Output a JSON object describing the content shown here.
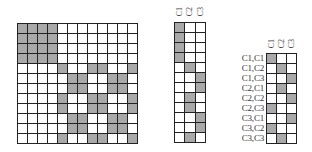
{
  "colors": {
    "filled": "#a9a9a9",
    "empty": "#ffffff",
    "line": "#222222"
  },
  "big_matrix": {
    "rows": 12,
    "cols": 12,
    "cells": [
      [
        1,
        1,
        1,
        1,
        0,
        0,
        0,
        0,
        0,
        0,
        0,
        0
      ],
      [
        1,
        1,
        1,
        1,
        0,
        0,
        0,
        0,
        0,
        0,
        0,
        0
      ],
      [
        1,
        1,
        1,
        1,
        0,
        0,
        0,
        0,
        0,
        0,
        0,
        0
      ],
      [
        1,
        1,
        1,
        1,
        0,
        0,
        0,
        0,
        0,
        0,
        0,
        0
      ],
      [
        0,
        0,
        0,
        0,
        1,
        0,
        0,
        1,
        1,
        0,
        0,
        1
      ],
      [
        0,
        0,
        0,
        0,
        0,
        1,
        1,
        0,
        0,
        1,
        1,
        0
      ],
      [
        0,
        0,
        0,
        0,
        0,
        1,
        1,
        0,
        0,
        1,
        1,
        0
      ],
      [
        0,
        0,
        0,
        0,
        1,
        0,
        0,
        1,
        1,
        0,
        0,
        1
      ],
      [
        0,
        0,
        0,
        0,
        1,
        0,
        0,
        1,
        1,
        0,
        0,
        1
      ],
      [
        0,
        0,
        0,
        0,
        0,
        1,
        1,
        0,
        0,
        1,
        1,
        0
      ],
      [
        0,
        0,
        0,
        0,
        0,
        1,
        1,
        0,
        0,
        1,
        1,
        0
      ],
      [
        0,
        0,
        0,
        0,
        1,
        0,
        0,
        1,
        1,
        0,
        0,
        1
      ]
    ]
  },
  "middle_matrix": {
    "col_headers": [
      "C1",
      "C2",
      "C3"
    ],
    "rows": 12,
    "cols": 3,
    "cells": [
      [
        1,
        0,
        0
      ],
      [
        1,
        0,
        0
      ],
      [
        1,
        0,
        0
      ],
      [
        1,
        0,
        0
      ],
      [
        0,
        1,
        0
      ],
      [
        0,
        0,
        1
      ],
      [
        0,
        0,
        1
      ],
      [
        0,
        1,
        0
      ],
      [
        0,
        1,
        0
      ],
      [
        0,
        0,
        1
      ],
      [
        0,
        0,
        1
      ],
      [
        0,
        1,
        0
      ]
    ]
  },
  "right_matrix": {
    "col_headers": [
      "C1",
      "C2",
      "C3"
    ],
    "row_labels": [
      "C1,C1",
      "C1,C2",
      "C1,C3",
      "C2,C1",
      "C2,C2",
      "C2,C3",
      "C3,C1",
      "C3,C2",
      "C3,C3"
    ],
    "rows": 9,
    "cols": 3,
    "cells": [
      [
        1,
        0,
        0
      ],
      [
        0,
        1,
        0
      ],
      [
        0,
        0,
        1
      ],
      [
        0,
        1,
        0
      ],
      [
        0,
        0,
        1
      ],
      [
        1,
        0,
        0
      ],
      [
        0,
        0,
        1
      ],
      [
        1,
        0,
        0
      ],
      [
        0,
        1,
        0
      ]
    ]
  }
}
